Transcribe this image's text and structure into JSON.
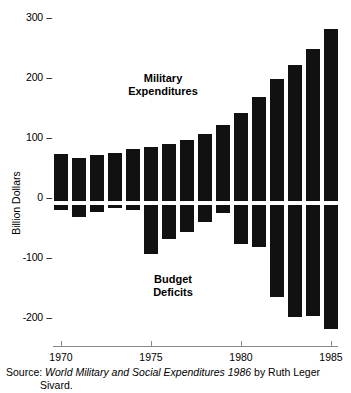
{
  "chart_data": {
    "type": "bar",
    "title": "",
    "xlabel": "",
    "ylabel": "Billion Dollars",
    "ylim": [
      -220,
      310
    ],
    "xlim": [
      1969.3,
      1985.7
    ],
    "grid": false,
    "legend": "none",
    "categories": [
      1970,
      1971,
      1972,
      1973,
      1974,
      1975,
      1976,
      1977,
      1978,
      1979,
      1980,
      1981,
      1982,
      1983,
      1984,
      1985
    ],
    "y_tick_labels": [
      "300",
      "200",
      "100",
      "0",
      "-100",
      "-200"
    ],
    "y_tick_values": [
      300,
      200,
      100,
      0,
      -100,
      -200
    ],
    "x_tick_labels": [
      "1970",
      "1975",
      "1980",
      "1985"
    ],
    "x_tick_values": [
      1970,
      1975,
      1980,
      1985
    ],
    "series": [
      {
        "name": "Military Expenditures",
        "values": [
          78,
          72,
          76,
          80,
          86,
          90,
          94,
          100,
          110,
          124,
          144,
          168,
          197,
          220,
          245,
          277
        ]
      },
      {
        "name": "Budget Deficits",
        "values": [
          -10,
          -22,
          -14,
          -8,
          -10,
          -80,
          -56,
          -46,
          -30,
          -16,
          -64,
          -70,
          -148,
          -180,
          -178,
          -200
        ]
      }
    ],
    "annotations": [
      {
        "id": "military",
        "text": "Military\nExpenditures"
      },
      {
        "id": "deficits",
        "text": "Budget\nDeficits"
      }
    ],
    "bar_color": "#111111"
  },
  "source": {
    "prefix": "Source: ",
    "title_italic": "World Military and Social Expenditures 1986",
    "suffix": " by Ruth Leger",
    "line2": "Sivard."
  },
  "axis": {
    "tick_dash": "–"
  }
}
